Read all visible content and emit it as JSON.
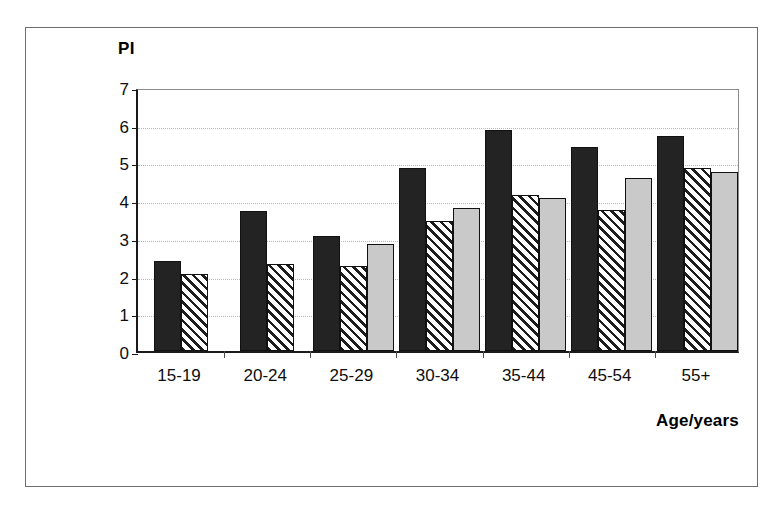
{
  "figure": {
    "y_axis_title": "PI",
    "x_axis_title": "Age/years"
  },
  "chart_data": {
    "type": "bar",
    "title": "",
    "subtitle": "",
    "xlabel": "Age/years",
    "ylabel": "PI",
    "ylim": [
      0,
      7
    ],
    "yticks": [
      0,
      1,
      2,
      3,
      4,
      5,
      6,
      7
    ],
    "ytick_labels": [
      "0",
      "1",
      "2",
      "3",
      "4",
      "5",
      "6",
      "7"
    ],
    "grid": true,
    "legend": false,
    "legend_position": "none",
    "categories": [
      "15-19",
      "20-24",
      "25-29",
      "30-34",
      "35-44",
      "45-54",
      "55+"
    ],
    "series": [
      {
        "name": "series-1",
        "style": "solid-dark",
        "color": "#232323",
        "values": [
          2.4,
          3.7,
          3.05,
          4.85,
          5.85,
          5.4,
          5.7
        ]
      },
      {
        "name": "series-2",
        "style": "diagonal-hatch",
        "color": "#ffffff",
        "values": [
          2.05,
          2.3,
          2.25,
          3.45,
          4.15,
          3.75,
          4.85
        ]
      },
      {
        "name": "series-3",
        "style": "solid-light-gray",
        "color": "#c9c9c9",
        "values": [
          null,
          null,
          2.85,
          3.8,
          4.05,
          4.6,
          4.75
        ]
      }
    ]
  }
}
